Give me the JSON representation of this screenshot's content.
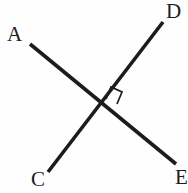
{
  "figure": {
    "background_color": "#fefefe",
    "ink_color": "#1c1c1c",
    "width": 188,
    "height": 193,
    "intersection": {
      "x": 100,
      "y": 104
    },
    "labels": [
      {
        "id": "A",
        "text": "A",
        "x": 7,
        "y": 24,
        "endpoint_of": "segment-AE"
      },
      {
        "id": "D",
        "text": "D",
        "x": 166,
        "y": 1,
        "endpoint_of": "segment-CD"
      },
      {
        "id": "C",
        "text": "C",
        "x": 31,
        "y": 169,
        "endpoint_of": "segment-CD"
      },
      {
        "id": "E",
        "text": "E",
        "x": 175,
        "y": 167,
        "endpoint_of": "segment-AE"
      }
    ],
    "segments": [
      {
        "id": "segment-AE",
        "from_label": "A",
        "to_label": "E",
        "x1": 30,
        "y1": 44,
        "x2": 176,
        "y2": 164
      },
      {
        "id": "segment-CD",
        "from_label": "C",
        "to_label": "D",
        "x1": 48,
        "y1": 172,
        "x2": 163,
        "y2": 22
      }
    ],
    "angle_marks": [
      {
        "id": "right-angle-mark",
        "type": "right-angle-square",
        "at_x": 100,
        "at_y": 104,
        "quadrant": "upper-right",
        "points": "106,99 111,87 122,92 117,104"
      }
    ]
  }
}
